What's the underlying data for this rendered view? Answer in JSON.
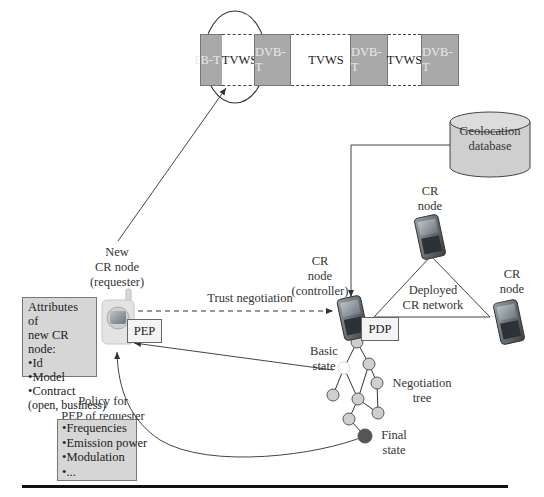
{
  "spectrum": {
    "bands": [
      {
        "type": "dvb",
        "label": "DVB-T"
      },
      {
        "type": "tvws",
        "label": "TVWS"
      },
      {
        "type": "dvb",
        "label": "DVB-T"
      },
      {
        "type": "tvws",
        "label": "TVWS"
      },
      {
        "type": "dvb",
        "label": "DVB-T"
      },
      {
        "type": "tvws",
        "label": "TVWS"
      },
      {
        "type": "dvb",
        "label": "DVB-T"
      }
    ]
  },
  "database": {
    "label_line1": "Geolocation",
    "label_line2": "database"
  },
  "new_node": {
    "line1": "New",
    "line2": "CR node",
    "line3": "(requester)",
    "pep_label": "PEP"
  },
  "attributes": {
    "title_line1": "Attributes of",
    "title_line2": "new CR node:",
    "items": [
      "Id",
      "Model",
      "Contract"
    ],
    "contract_detail": "(open, business)"
  },
  "trust": {
    "label": "Trust negotiation"
  },
  "controller": {
    "line1": "CR",
    "line2": "node",
    "line3": "(controller)",
    "pdp_label": "PDP"
  },
  "network": {
    "line1": "Deployed",
    "line2": "CR network"
  },
  "cr_node_top": {
    "line1": "CR",
    "line2": "node"
  },
  "cr_node_right": {
    "line1": "CR",
    "line2": "node"
  },
  "tree": {
    "basic_state_line1": "Basic",
    "basic_state_line2": "state",
    "negotiation_line1": "Negotiation",
    "negotiation_line2": "tree",
    "final_line1": "Final",
    "final_line2": "state"
  },
  "policy": {
    "title_line1": "Policy for",
    "title_line2": "PEP of requester",
    "items": [
      "Frequencies",
      "Emission power",
      "Modulation",
      "..."
    ]
  },
  "colors": {
    "dvb_fill": "#a9a9a9",
    "box_fill": "#d6d6d6",
    "tree_node": "#cfcfcf",
    "final_node": "#555555"
  }
}
